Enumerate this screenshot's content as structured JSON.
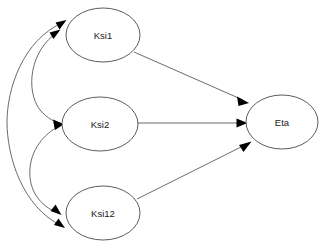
{
  "diagram": {
    "type": "path-diagram",
    "title": "",
    "background_color": "#ffffff",
    "node_fill_color": "#ffffff",
    "node_stroke_color": "#4a4a4a",
    "edge_color": "#5a5a5a",
    "arrowhead_color": "#000000",
    "label_color": "#1a1a1a",
    "nodes": [
      {
        "id": "ksi1",
        "label": "Ksi1",
        "shape": "ellipse",
        "cx": 103,
        "cy": 35,
        "rx": 37,
        "ry": 27
      },
      {
        "id": "ksi2",
        "label": "Ksi2",
        "shape": "ellipse",
        "cx": 100,
        "cy": 124,
        "rx": 38,
        "ry": 27
      },
      {
        "id": "ksi12",
        "label": "Ksi12",
        "shape": "ellipse",
        "cx": 103,
        "cy": 213,
        "rx": 37,
        "ry": 27
      },
      {
        "id": "eta",
        "label": "Eta",
        "shape": "ellipse",
        "cx": 282,
        "cy": 122,
        "rx": 36,
        "ry": 27
      }
    ],
    "edges": [
      {
        "id": "ksi1-to-eta",
        "from": "ksi1",
        "to": "eta",
        "style": "straight",
        "arrows": "single",
        "label": ""
      },
      {
        "id": "ksi2-to-eta",
        "from": "ksi2",
        "to": "eta",
        "style": "straight",
        "arrows": "single",
        "label": ""
      },
      {
        "id": "ksi12-to-eta",
        "from": "ksi12",
        "to": "eta",
        "style": "straight",
        "arrows": "single",
        "label": ""
      },
      {
        "id": "ksi1-ksi2-covariance",
        "from": "ksi1",
        "to": "ksi2",
        "style": "curved",
        "arrows": "double",
        "label": ""
      },
      {
        "id": "ksi2-ksi12-covariance",
        "from": "ksi2",
        "to": "ksi12",
        "style": "curved",
        "arrows": "double",
        "label": ""
      },
      {
        "id": "ksi1-ksi12-covariance",
        "from": "ksi1",
        "to": "ksi12",
        "style": "curved-outer",
        "arrows": "double",
        "label": ""
      }
    ]
  }
}
